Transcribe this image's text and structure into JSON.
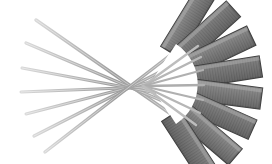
{
  "figure": {
    "title": "Fan-shaped detector array with converging ray paths",
    "type": "technical-illustration",
    "background_color": "#ffffff",
    "canvas": {
      "width": 272,
      "height": 164
    },
    "focal_point": {
      "x": 143,
      "y": 86
    },
    "fan_center": {
      "x": 150,
      "y": 84
    },
    "colors": {
      "panel_light": "#9a9a9a",
      "panel_mid": "#7c7c7c",
      "panel_dark": "#5e5e5e",
      "panel_edge": "#3c3c3c",
      "panel_stripe": "#636363",
      "panel_highlight": "#b4b4b4",
      "ray_light": "#c9c9c9",
      "ray_mid": "#a8a8a8",
      "ray_dark": "#8f8f8f",
      "background": "#ffffff"
    },
    "panel_array": {
      "name": "detector-panel-fan",
      "segment_count": 8,
      "inner_radius": 38,
      "outer_radius": 112,
      "angle_start_deg": -64,
      "angle_end_deg": 64,
      "stripe_count": 16,
      "segments": [
        {
          "index": 0,
          "angle_deg": -58.5,
          "shade": "#6e6e6e",
          "label": "panel-1"
        },
        {
          "index": 1,
          "angle_deg": -42.0,
          "shade": "#828282",
          "label": "panel-2"
        },
        {
          "index": 2,
          "angle_deg": -25.5,
          "shade": "#767676",
          "label": "panel-3"
        },
        {
          "index": 3,
          "angle_deg": -9.0,
          "shade": "#888888",
          "label": "panel-4"
        },
        {
          "index": 4,
          "angle_deg": 7.5,
          "shade": "#737373",
          "label": "panel-5"
        },
        {
          "index": 5,
          "angle_deg": 24.0,
          "shade": "#858585",
          "label": "panel-6"
        },
        {
          "index": 6,
          "angle_deg": 40.5,
          "shade": "#757575",
          "label": "panel-7"
        },
        {
          "index": 7,
          "angle_deg": 57.0,
          "shade": "#6a6a6a",
          "label": "panel-8"
        }
      ]
    },
    "ray_bundle": {
      "name": "converging-ray-beams",
      "ray_count": 7,
      "description": "Long thin tapered beams crossing at the focal point",
      "rays": [
        {
          "index": 0,
          "tip_x": 36,
          "tip_y": 20,
          "end_x": 214,
          "end_y": 144,
          "width": 3.4,
          "shade": "#b8b8b8"
        },
        {
          "index": 1,
          "tip_x": 26,
          "tip_y": 43,
          "end_x": 219,
          "end_y": 125,
          "width": 3.2,
          "shade": "#aeaeae"
        },
        {
          "index": 2,
          "tip_x": 22,
          "tip_y": 68,
          "end_x": 222,
          "end_y": 105,
          "width": 3.0,
          "shade": "#a6a6a6"
        },
        {
          "index": 3,
          "tip_x": 21,
          "tip_y": 92,
          "end_x": 222,
          "end_y": 84,
          "width": 3.0,
          "shade": "#a2a2a2"
        },
        {
          "index": 4,
          "tip_x": 26,
          "tip_y": 114,
          "end_x": 220,
          "end_y": 64,
          "width": 3.0,
          "shade": "#a8a8a8"
        },
        {
          "index": 5,
          "tip_x": 34,
          "tip_y": 136,
          "end_x": 215,
          "end_y": 44,
          "width": 3.2,
          "shade": "#b0b0b0"
        },
        {
          "index": 6,
          "tip_x": 45,
          "tip_y": 152,
          "end_x": 208,
          "end_y": 26,
          "width": 3.4,
          "shade": "#bcbcbc"
        }
      ]
    },
    "aperture": {
      "name": "white-aperture-gap",
      "description": "Bright arc-shaped gap between ray bundle and panel inner edge",
      "color": "#ffffff"
    }
  }
}
